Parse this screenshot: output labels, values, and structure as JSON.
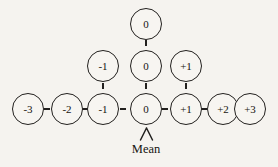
{
  "diagram": {
    "background_color": "#f5f3ef",
    "stroke_color": "#22201e",
    "node_fill": "#f7f5f1",
    "text_color": "#16140f",
    "annotation": {
      "label": "Mean",
      "pointer_icon": "caret-up-icon",
      "points_to": "center-zero-node"
    },
    "rows": [
      {
        "name": "top-row",
        "y": 8,
        "nodes": [
          {
            "label": "0",
            "x": 130
          }
        ]
      },
      {
        "name": "middle-row",
        "y": 50,
        "nodes": [
          {
            "label": "-1",
            "x": 87
          },
          {
            "label": "0",
            "x": 130
          },
          {
            "label": "+1",
            "x": 170
          }
        ]
      },
      {
        "name": "bottom-row",
        "y": 93,
        "nodes": [
          {
            "label": "-3",
            "x": 12
          },
          {
            "label": "-2",
            "x": 51
          },
          {
            "label": "-1",
            "x": 87
          },
          {
            "label": "0",
            "x": 130
          },
          {
            "label": "+1",
            "x": 170
          },
          {
            "label": "+2",
            "x": 207
          },
          {
            "label": "+3",
            "x": 234
          }
        ]
      }
    ],
    "connectors": [
      {
        "name": "connector-top-0-to-mid-0",
        "orientation": "v",
        "x": 144.7,
        "y": 40
      },
      {
        "name": "connector-mid-0-to-bottom-0",
        "orientation": "v",
        "x": 144.7,
        "y": 83
      },
      {
        "name": "connector-mid-neg1-to-bottom-neg1",
        "orientation": "v",
        "x": 101.7,
        "y": 83
      },
      {
        "name": "connector-mid-pos1-to-bottom-pos1",
        "orientation": "v",
        "x": 184.7,
        "y": 83
      },
      {
        "name": "connector-neg3-to-neg2",
        "orientation": "h",
        "x": 44,
        "y": 107.7
      },
      {
        "name": "connector-neg2-to-neg1",
        "orientation": "h",
        "x": 82,
        "y": 107.7
      },
      {
        "name": "connector-neg1-to-0",
        "orientation": "h",
        "x": 120,
        "y": 107.7
      },
      {
        "name": "connector-0-to-pos1",
        "orientation": "h",
        "x": 162,
        "y": 107.7
      },
      {
        "name": "connector-pos1-to-pos2",
        "orientation": "h",
        "x": 201,
        "y": 107.7
      },
      {
        "name": "connector-pos2-to-pos3",
        "orientation": "h",
        "x": 228,
        "y": 107.7
      }
    ]
  }
}
